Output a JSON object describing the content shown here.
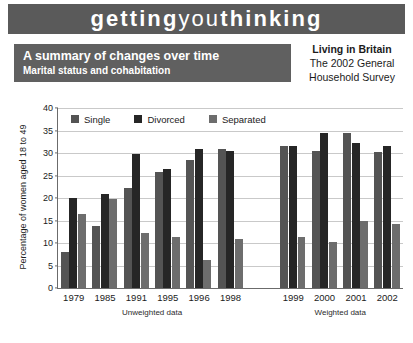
{
  "masthead": {
    "part1": "getting",
    "part2": "you",
    "part3": "thinking",
    "background": "#5a5a5a"
  },
  "title_band": {
    "main": "A summary of changes over time",
    "sub": "Marital status and cohabitation",
    "background": "#606060"
  },
  "source": {
    "line1": "Living in Britain",
    "line2": "The 2002 General",
    "line3": "Household Survey"
  },
  "chart_data": {
    "type": "bar",
    "title": "A summary of changes over time",
    "subtitle": "Marital status and cohabitation",
    "xlabel": "",
    "ylabel": "Percentage of women aged 18 to 49",
    "ylim": [
      0,
      40
    ],
    "yticks": [
      0,
      5,
      10,
      15,
      20,
      25,
      30,
      35,
      40
    ],
    "ytick_labels": [
      "0",
      "5",
      "10",
      "15",
      "20",
      "25",
      "30",
      "35",
      "40"
    ],
    "grid": true,
    "legend_position": "top-left-inside",
    "categories": [
      "1979",
      "1985",
      "1991",
      "1995",
      "1996",
      "1998",
      "1999",
      "2000",
      "2001",
      "2002"
    ],
    "group_labels": [
      {
        "label": "Unweighted data",
        "categories": [
          "1979",
          "1985",
          "1991",
          "1995",
          "1996",
          "1998"
        ]
      },
      {
        "label": "Weighted data",
        "categories": [
          "1999",
          "2000",
          "2001",
          "2002"
        ]
      }
    ],
    "series": [
      {
        "name": "Single",
        "color": "#545454",
        "values": [
          8.0,
          13.8,
          22.3,
          25.8,
          28.5,
          30.8,
          31.5,
          30.5,
          34.5,
          30.3
        ]
      },
      {
        "name": "Divorced",
        "color": "#262626",
        "values": [
          20.0,
          20.8,
          29.8,
          26.5,
          30.8,
          30.5,
          31.5,
          34.5,
          32.3,
          31.5
        ]
      },
      {
        "name": "Separated",
        "color": "#6d6d6d",
        "values": [
          16.5,
          19.8,
          12.3,
          11.3,
          6.3,
          10.8,
          11.3,
          10.3,
          15.0,
          14.3
        ]
      }
    ]
  }
}
